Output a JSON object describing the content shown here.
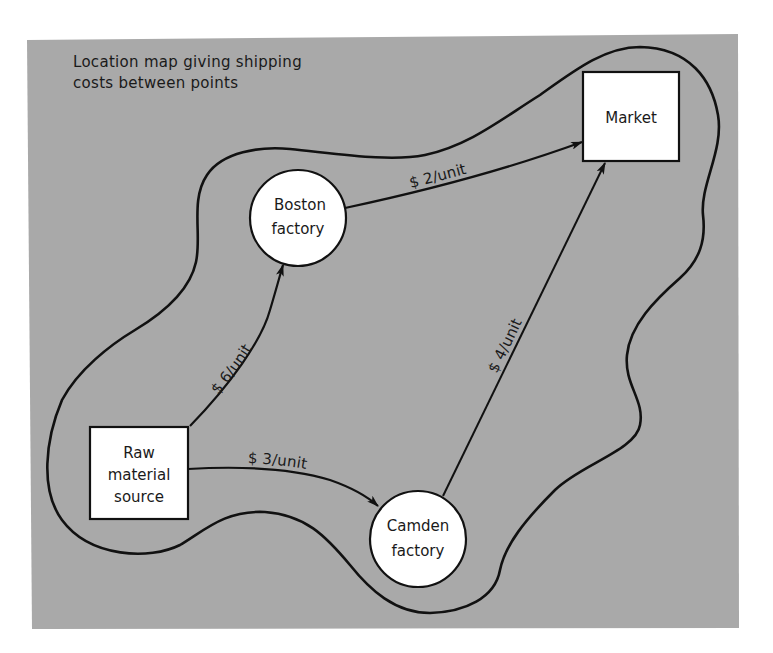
{
  "diagram": {
    "title_lines": [
      "Location map giving shipping",
      "costs between points"
    ],
    "background_color": "#a9a9a9",
    "region_outline_color": "#111111",
    "nodes": {
      "raw": {
        "shape": "square",
        "lines": [
          "Raw",
          "material",
          "source"
        ]
      },
      "boston": {
        "shape": "circle",
        "lines": [
          "Boston",
          "factory"
        ]
      },
      "camden": {
        "shape": "circle",
        "lines": [
          "Camden",
          "factory"
        ]
      },
      "market": {
        "shape": "square",
        "lines": [
          "Market"
        ]
      }
    },
    "edges": [
      {
        "from": "Raw material source",
        "to": "Boston factory",
        "label": "$ 6/unit"
      },
      {
        "from": "Raw material source",
        "to": "Camden factory",
        "label": "$ 3/unit"
      },
      {
        "from": "Boston factory",
        "to": "Market",
        "label": "$ 2/unit"
      },
      {
        "from": "Camden factory",
        "to": "Market",
        "label": "$ 4/unit"
      }
    ]
  }
}
